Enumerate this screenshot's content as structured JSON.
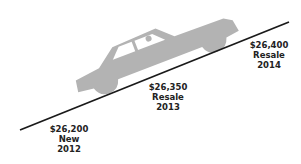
{
  "colors": {
    "line": "#1a1a1a",
    "car": "#b3b3b3",
    "text": "#222222"
  },
  "labels": [
    {
      "price": "$26,200",
      "status": "New",
      "year": "2012"
    },
    {
      "price": "$26,350",
      "status": "Resale",
      "year": "2013"
    },
    {
      "price": "$26,400",
      "status": "Resale",
      "year": "2014"
    }
  ]
}
